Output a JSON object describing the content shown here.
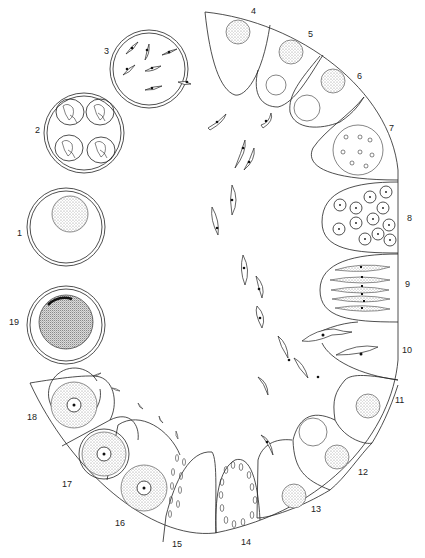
{
  "figure": {
    "type": "life-cycle diagram",
    "stage_labels": [
      "1",
      "2",
      "3",
      "4",
      "5",
      "6",
      "7",
      "8",
      "9",
      "10",
      "11",
      "12",
      "13",
      "14",
      "15",
      "16",
      "17",
      "18",
      "19"
    ]
  },
  "labels": {
    "s1": "1",
    "s2": "2",
    "s3": "3",
    "s4": "4",
    "s5": "5",
    "s6": "6",
    "s7": "7",
    "s8": "8",
    "s9": "9",
    "s10": "10",
    "s11": "11",
    "s12": "12",
    "s13": "13",
    "s14": "14",
    "s15": "15",
    "s16": "16",
    "s17": "17",
    "s18": "18",
    "s19": "19"
  },
  "colors": {
    "line": "#222222",
    "background": "#ffffff",
    "stipple": "#888888"
  }
}
